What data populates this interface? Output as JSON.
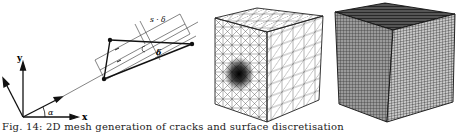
{
  "figure": {
    "caption": "Fig. 14: 2D mesh generation of cracks and surface discretisation",
    "panels": [
      {
        "id": "a",
        "type": "geometry-diagram",
        "labels": {
          "y_axis": "y",
          "x_axis": "x",
          "angle": "α",
          "projection_top": "s · δ",
          "offset": "δ"
        }
      },
      {
        "id": "b",
        "type": "tetrahedral-cube-mesh",
        "description": "Cube with triangulated surfaces and local refinement spot on front face"
      },
      {
        "id": "c",
        "type": "layered-cube-mesh",
        "description": "Cube with dense layered/hexahedral discretisation"
      }
    ]
  },
  "colors": {
    "line": "#111111",
    "mesh_light": "#555555",
    "mesh_dense": "#222222",
    "background": "#ffffff"
  }
}
